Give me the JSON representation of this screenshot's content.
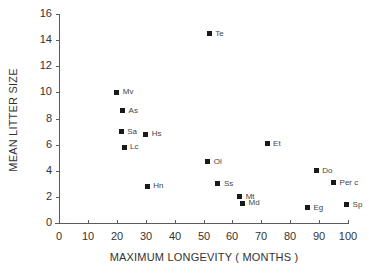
{
  "chart_data": {
    "type": "scatter",
    "title": "",
    "xlabel": "MAXIMUM LONGEVITY ( MONTHS )",
    "ylabel": "MEAN LITTER SIZE",
    "xlim": [
      0,
      100
    ],
    "ylim": [
      0,
      16
    ],
    "x_ticks": [
      0,
      10,
      20,
      30,
      40,
      50,
      60,
      70,
      80,
      90,
      100
    ],
    "y_ticks": [
      0,
      2,
      4,
      6,
      8,
      10,
      12,
      14,
      16
    ],
    "grid": false,
    "legend": null,
    "marker": "square",
    "points": [
      {
        "label": "Te",
        "x": 52,
        "y": 14.5
      },
      {
        "label": "Mv",
        "x": 20,
        "y": 10.0
      },
      {
        "label": "As",
        "x": 22,
        "y": 8.6
      },
      {
        "label": "Sa",
        "x": 21.5,
        "y": 7.0
      },
      {
        "label": "Hs",
        "x": 30,
        "y": 6.8
      },
      {
        "label": "Lc",
        "x": 22.5,
        "y": 5.8
      },
      {
        "label": "Et",
        "x": 72,
        "y": 6.05
      },
      {
        "label": "Ol",
        "x": 51.5,
        "y": 4.7
      },
      {
        "label": "Do",
        "x": 89,
        "y": 4.0
      },
      {
        "label": "Per c",
        "x": 95,
        "y": 3.1
      },
      {
        "label": "Ss",
        "x": 55,
        "y": 3.0
      },
      {
        "label": "Hn",
        "x": 30.5,
        "y": 2.8
      },
      {
        "label": "Mt",
        "x": 62.5,
        "y": 2.0
      },
      {
        "label": "Md",
        "x": 63.5,
        "y": 1.5
      },
      {
        "label": "Sp",
        "x": 99.5,
        "y": 1.4
      },
      {
        "label": "Eg",
        "x": 86,
        "y": 1.15
      }
    ]
  }
}
